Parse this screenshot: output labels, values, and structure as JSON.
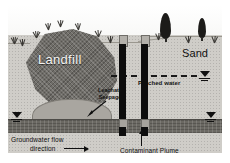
{
  "figure": {
    "type": "hydrogeologic-cross-section",
    "title_visible": false
  },
  "labels": {
    "landfill": "Landfill",
    "sand": "Sand",
    "leachate_line1": "Leachate",
    "leachate_line2": "Seepage",
    "perched_water": "Perched water",
    "groundwater_line1": "Groundwater flow",
    "groundwater_line2": "direction",
    "contaminant_plume": "Contaminant Plume"
  },
  "icons": {
    "water_table_left": "water-table-symbol",
    "water_table_right": "water-table-symbol",
    "water_table_perched": "water-table-symbol",
    "flow_arrow": "right-arrow-icon",
    "plume_arrow": "up-arrow-icon",
    "seepage_arrow": "diagonal-arrow-icon",
    "tree_tall": "conifer-tree-icon",
    "tree_short": "conifer-tree-icon",
    "grass": "grass-tuft-icon"
  },
  "features": {
    "wells": [
      {
        "name": "monitoring-well-1"
      },
      {
        "name": "monitoring-well-2"
      }
    ],
    "strata": [
      {
        "name": "sky"
      },
      {
        "name": "sand-unit"
      },
      {
        "name": "landfill-mass"
      },
      {
        "name": "leachate-mound"
      },
      {
        "name": "contaminant-plume-band"
      }
    ]
  },
  "colors": {
    "sand": "#cfcdc8",
    "landfill": "#6f6d68",
    "plume": "#6b6963",
    "leachate": "#a9a6a0",
    "well_shaft": "#0d0d0d",
    "well_cap": "#b3b0aa",
    "sky": "#ffffff",
    "ink": "#0f0f0f"
  }
}
